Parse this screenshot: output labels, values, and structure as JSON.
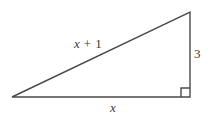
{
  "figure": {
    "type": "right-triangle-diagram",
    "background_color": "#ffffff",
    "stroke_color": "#4a4a4a",
    "text_color": "#3b3b3b",
    "labels": {
      "hypotenuse": "x + 1",
      "hypotenuse_variable": "x",
      "hypotenuse_rest": " + 1",
      "vertical_leg": "3",
      "horizontal_leg": "x"
    },
    "geometry": {
      "left_vertex": "12,97",
      "top_vertex": "190,12",
      "right_angle_vertex": "190,97",
      "right_angle_marker": "square",
      "right_angle_marker_size": "9"
    }
  }
}
